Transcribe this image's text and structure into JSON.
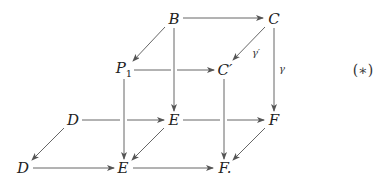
{
  "diagram": {
    "type": "commutative-cube",
    "nodes": {
      "B": {
        "label": "B",
        "x": 174,
        "y": 19
      },
      "C": {
        "label": "C",
        "x": 273,
        "y": 19
      },
      "P1": {
        "label": "P",
        "sub": "1",
        "x": 124,
        "y": 70
      },
      "Cp": {
        "label": "C′",
        "x": 224,
        "y": 70
      },
      "D_back": {
        "label": "D",
        "x": 73,
        "y": 120
      },
      "E_back": {
        "label": "E",
        "x": 173,
        "y": 120
      },
      "F_back": {
        "label": "F",
        "x": 273,
        "y": 120
      },
      "D_front": {
        "label": "D",
        "x": 23,
        "y": 168
      },
      "E_front": {
        "label": "E",
        "x": 123,
        "y": 168
      },
      "F_front": {
        "label": "F.",
        "x": 222,
        "y": 168
      }
    },
    "edges": [
      {
        "from": "B",
        "to": "C"
      },
      {
        "from": "B",
        "to": "P1"
      },
      {
        "from": "C",
        "to": "Cp",
        "label": "γ′"
      },
      {
        "from": "C",
        "to": "F_back",
        "label": "γ"
      },
      {
        "from": "P1",
        "to": "Cp"
      },
      {
        "from": "B",
        "to": "E_back"
      },
      {
        "from": "P1",
        "to": "E_front"
      },
      {
        "from": "Cp",
        "to": "F_front"
      },
      {
        "from": "D_back",
        "to": "E_back"
      },
      {
        "from": "E_back",
        "to": "F_back"
      },
      {
        "from": "D_back",
        "to": "D_front"
      },
      {
        "from": "E_back",
        "to": "E_front"
      },
      {
        "from": "F_back",
        "to": "F_front"
      },
      {
        "from": "D_front",
        "to": "E_front"
      },
      {
        "from": "E_front",
        "to": "F_front"
      }
    ],
    "edge_labels": {
      "gamma_prime": "γ′",
      "gamma": "γ"
    },
    "equation_tag": "(∗)",
    "colors": {
      "line": "#555555",
      "text": "#222222",
      "background": "#ffffff"
    }
  }
}
